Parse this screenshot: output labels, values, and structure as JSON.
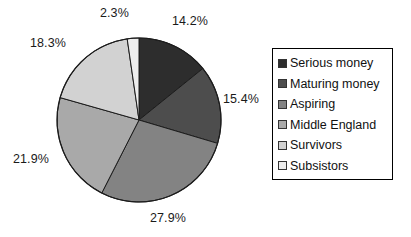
{
  "chart_data": {
    "type": "pie",
    "title": "",
    "labels": [
      "Serious money",
      "Maturing money",
      "Aspiring",
      "Middle England",
      "Survivors",
      "Subsistors"
    ],
    "values": [
      14.2,
      15.4,
      27.9,
      21.9,
      18.3,
      2.3
    ],
    "value_labels": [
      "14.2%",
      "15.4%",
      "27.9%",
      "21.9%",
      "18.3%",
      "2.3%"
    ],
    "colors": [
      "#2d2d2d",
      "#4d4d4d",
      "#838383",
      "#a9a9a9",
      "#d2d2d2",
      "#ededed"
    ],
    "units": "percent",
    "start_angle_deg": 0,
    "direction": "clockwise",
    "legend_position": "right",
    "grid": false,
    "xlabel": "",
    "ylabel": ""
  },
  "legend": {
    "items": [
      {
        "label": "Serious money",
        "color": "#2d2d2d"
      },
      {
        "label": "Maturing money",
        "color": "#4d4d4d"
      },
      {
        "label": "Aspiring",
        "color": "#838383"
      },
      {
        "label": "Middle England",
        "color": "#a9a9a9"
      },
      {
        "label": "Survivors",
        "color": "#d2d2d2"
      },
      {
        "label": "Subsistors",
        "color": "#ededed"
      }
    ]
  }
}
